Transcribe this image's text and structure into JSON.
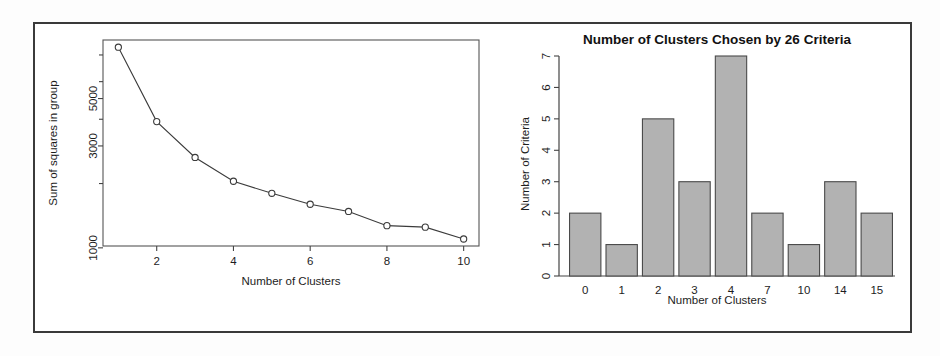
{
  "figure": {
    "panels": [
      "elbow-plot",
      "criteria-bar-chart"
    ],
    "border_color": "#3a3a3a",
    "background_color": "#ffffff"
  },
  "chart_data": [
    {
      "id": "elbow-plot",
      "type": "line",
      "title": "",
      "xlabel": "Number of Clusters",
      "ylabel": "Sum of squares in group",
      "x": [
        1,
        2,
        3,
        4,
        5,
        6,
        7,
        8,
        9,
        10
      ],
      "values": [
        8700,
        3900,
        2650,
        2050,
        1800,
        1600,
        1480,
        1270,
        1250,
        1100
      ],
      "xtick_labels": [
        "2",
        "4",
        "6",
        "8",
        "10"
      ],
      "xticks": [
        2,
        4,
        6,
        8,
        10
      ],
      "ytick_labels": [
        "1000",
        "3000",
        "5000"
      ],
      "yticks": [
        1000,
        3000,
        5000
      ],
      "yscale": "log",
      "ylim": [
        1020,
        9400
      ],
      "xlim": [
        0.6,
        10.4
      ],
      "grid": false,
      "legend": "none",
      "marker": "open-circle",
      "line_color": "#3b3b3b",
      "marker_fill": "#ffffff"
    },
    {
      "id": "criteria-bar-chart",
      "type": "bar",
      "title": "Number of Clusters Chosen by 26 Criteria",
      "xlabel": "Number of Clusters",
      "ylabel": "Number of Criteria",
      "categories": [
        "0",
        "1",
        "2",
        "3",
        "4",
        "7",
        "10",
        "14",
        "15"
      ],
      "values": [
        2,
        1,
        5,
        3,
        7,
        2,
        1,
        3,
        2
      ],
      "ytick_labels": [
        "0",
        "1",
        "2",
        "3",
        "4",
        "5",
        "6",
        "7"
      ],
      "yticks": [
        0,
        1,
        2,
        3,
        4,
        5,
        6,
        7
      ],
      "ylim": [
        0,
        7
      ],
      "grid": false,
      "legend": "none",
      "bar_fill": "#b2b2b2",
      "bar_stroke": "#4a4a4a"
    }
  ]
}
